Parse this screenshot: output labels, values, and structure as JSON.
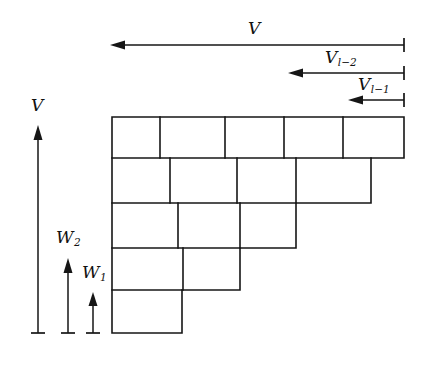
{
  "figure": {
    "background_color": "#ffffff",
    "stroke_color": "#161616",
    "width": 437,
    "height": 367
  },
  "horizontal_arrows": [
    {
      "id": "arrow-V-top",
      "label": "V",
      "label_main": "V",
      "label_sub": "",
      "direction": "left",
      "x_start": 404,
      "x_end": 110,
      "y": 45,
      "label_x": 248,
      "label_y": 20
    },
    {
      "id": "arrow-V-l-minus-2",
      "label": "V l-2",
      "label_main": "V",
      "label_sub": "l−2",
      "direction": "left",
      "x_start": 404,
      "x_end": 288,
      "y": 73,
      "label_x": 325,
      "label_y": 49
    },
    {
      "id": "arrow-V-l-minus-1",
      "label": "V l-1",
      "label_main": "V",
      "label_sub": "l−1",
      "direction": "left",
      "x_start": 404,
      "x_end": 348,
      "y": 100,
      "label_x": 358,
      "label_y": 76
    }
  ],
  "vertical_arrows": [
    {
      "id": "arrow-V-left",
      "label": "V",
      "label_main": "V",
      "label_sub": "",
      "direction": "up",
      "x": 38,
      "y_start": 333,
      "y_end": 125,
      "label_x": 31,
      "label_y": 97
    },
    {
      "id": "arrow-W2",
      "label": "W 2",
      "label_main": "W",
      "label_sub": "2",
      "direction": "up",
      "x": 68,
      "y_start": 333,
      "y_end": 258,
      "label_x": 56,
      "label_y": 229
    },
    {
      "id": "arrow-W1",
      "label": "W 1",
      "label_main": "W",
      "label_sub": "1",
      "direction": "up",
      "x": 93,
      "y_start": 333,
      "y_end": 292,
      "label_x": 82,
      "label_y": 264
    }
  ],
  "staircase": {
    "description": "Five-row offset brick staircase, rows shrink from 5 cells to 1 cell",
    "left_edge_x": 112,
    "row_y": [
      117,
      158,
      203,
      248,
      290,
      333
    ],
    "rows": [
      {
        "index": 1,
        "y_top": 117,
        "y_bottom": 158,
        "x_left": 112,
        "x_right": 404,
        "cell_dividers": [
          160,
          225,
          284,
          343
        ]
      },
      {
        "index": 2,
        "y_top": 158,
        "y_bottom": 203,
        "x_left": 112,
        "x_right": 371,
        "cell_dividers": [
          170,
          237,
          296
        ]
      },
      {
        "index": 3,
        "y_top": 203,
        "y_bottom": 248,
        "x_left": 112,
        "x_right": 296,
        "cell_dividers": [
          178,
          240
        ]
      },
      {
        "index": 4,
        "y_top": 248,
        "y_bottom": 290,
        "x_left": 112,
        "x_right": 240,
        "cell_dividers": [
          183
        ]
      },
      {
        "index": 5,
        "y_top": 290,
        "y_bottom": 333,
        "x_left": 112,
        "x_right": 182,
        "cell_dividers": []
      }
    ]
  }
}
